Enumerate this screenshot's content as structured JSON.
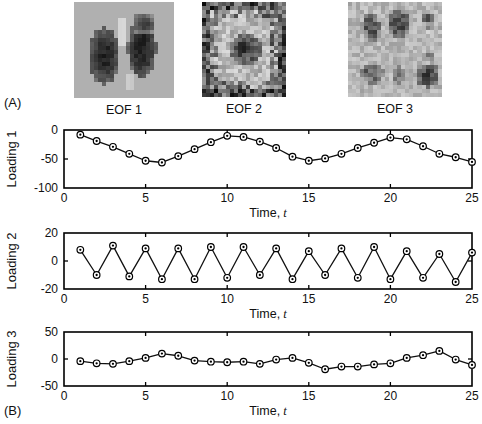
{
  "figure": {
    "panel_a_label": "(A)",
    "panel_b_label": "(B)"
  },
  "panel_a": {
    "images": [
      {
        "caption": "EOF 1",
        "name": "eof-1-image"
      },
      {
        "caption": "EOF 2",
        "name": "eof-2-image"
      },
      {
        "caption": "EOF 3",
        "name": "eof-3-image"
      }
    ]
  },
  "chart_data": [
    {
      "type": "line",
      "name": "loading-1",
      "title": "",
      "xlabel": "Time, t",
      "ylabel": "Loading 1",
      "xlim": [
        0,
        25
      ],
      "ylim": [
        -100,
        0
      ],
      "xticks": [
        0,
        5,
        10,
        15,
        20,
        25
      ],
      "xticklabels": [
        "0",
        "5",
        "10",
        "15",
        "20",
        "25"
      ],
      "yticks": [
        -100,
        -50,
        0
      ],
      "yticklabels": [
        "-100",
        "-50",
        "0"
      ],
      "grid": false,
      "legend": "none",
      "marker": "circle-dot",
      "x": [
        1,
        2,
        3,
        4,
        5,
        6,
        7,
        8,
        9,
        10,
        11,
        12,
        13,
        14,
        15,
        16,
        17,
        18,
        19,
        20,
        21,
        22,
        23,
        24,
        25
      ],
      "values": [
        -8,
        -19,
        -29,
        -41,
        -53,
        -56,
        -45,
        -33,
        -21,
        -10,
        -12,
        -20,
        -31,
        -46,
        -53,
        -49,
        -41,
        -31,
        -22,
        -13,
        -16,
        -28,
        -41,
        -47,
        -55
      ]
    },
    {
      "type": "line",
      "name": "loading-2",
      "title": "",
      "xlabel": "Time, t",
      "ylabel": "Loading 2",
      "xlim": [
        0,
        25
      ],
      "ylim": [
        -20,
        20
      ],
      "xticks": [
        0,
        5,
        10,
        15,
        20,
        25
      ],
      "xticklabels": [
        "0",
        "5",
        "10",
        "15",
        "20",
        "25"
      ],
      "yticks": [
        -20,
        0,
        20
      ],
      "yticklabels": [
        "-20",
        "0",
        "20"
      ],
      "grid": false,
      "legend": "none",
      "marker": "circle-dot",
      "x": [
        1,
        2,
        3,
        4,
        5,
        6,
        7,
        8,
        9,
        10,
        11,
        12,
        13,
        14,
        15,
        16,
        17,
        18,
        19,
        20,
        21,
        22,
        23,
        24,
        25
      ],
      "values": [
        8,
        -10,
        11,
        -11,
        9,
        -13,
        9,
        -13,
        10,
        -12,
        10,
        -10,
        9,
        -13,
        7,
        -10,
        9,
        -12,
        10,
        -13,
        7,
        -12,
        5,
        -15,
        6
      ]
    },
    {
      "type": "line",
      "name": "loading-3",
      "title": "",
      "xlabel": "Time, t",
      "ylabel": "Loading 3",
      "xlim": [
        0,
        25
      ],
      "ylim": [
        -50,
        50
      ],
      "xticks": [
        0,
        5,
        10,
        15,
        20,
        25
      ],
      "xticklabels": [
        "0",
        "5",
        "10",
        "15",
        "20",
        "25"
      ],
      "yticks": [
        -50,
        0,
        50
      ],
      "yticklabels": [
        "-50",
        "0",
        "50"
      ],
      "grid": false,
      "legend": "none",
      "marker": "circle-dot",
      "x": [
        1,
        2,
        3,
        4,
        5,
        6,
        7,
        8,
        9,
        10,
        11,
        12,
        13,
        14,
        15,
        16,
        17,
        18,
        19,
        20,
        21,
        22,
        23,
        24,
        25
      ],
      "values": [
        -4,
        -8,
        -9,
        -4,
        2,
        10,
        6,
        -3,
        -5,
        -6,
        -5,
        -9,
        -1,
        2,
        -7,
        -19,
        -14,
        -14,
        -10,
        -8,
        2,
        7,
        15,
        -1,
        -11
      ]
    }
  ]
}
